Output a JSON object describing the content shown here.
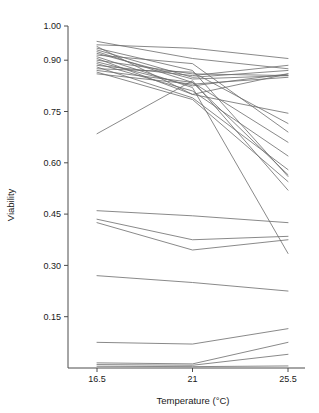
{
  "chart_data": {
    "type": "line",
    "title": "",
    "xlabel": "Temperature (°C)",
    "ylabel": "Viability",
    "x": [
      16.5,
      21,
      25.5
    ],
    "xtick_labels": [
      "16.5",
      "21",
      "25.5"
    ],
    "ytick_labels": [
      "1.00",
      "0.90",
      "0.75",
      "0.60",
      "0.45",
      "0.30",
      "0.15"
    ],
    "ytick_values": [
      1.0,
      0.9,
      0.75,
      0.6,
      0.45,
      0.3,
      0.15
    ],
    "ylim": [
      0.0,
      1.0
    ],
    "xlim": [
      16.5,
      25.5
    ],
    "grid": false,
    "legend": "none",
    "series": [
      {
        "name": "line-01",
        "values": [
          0.955,
          0.905,
          0.875
        ]
      },
      {
        "name": "line-02",
        "values": [
          0.945,
          0.935,
          0.905
        ]
      },
      {
        "name": "line-03",
        "values": [
          0.94,
          0.8,
          0.86
        ]
      },
      {
        "name": "line-04",
        "values": [
          0.935,
          0.87,
          0.56
        ]
      },
      {
        "name": "line-05",
        "values": [
          0.93,
          0.85,
          0.87
        ]
      },
      {
        "name": "line-06",
        "values": [
          0.925,
          0.835,
          0.66
        ]
      },
      {
        "name": "line-07",
        "values": [
          0.92,
          0.845,
          0.855
        ]
      },
      {
        "name": "line-08",
        "values": [
          0.915,
          0.89,
          0.69
        ]
      },
      {
        "name": "line-09",
        "values": [
          0.91,
          0.82,
          0.335
        ]
      },
      {
        "name": "line-10",
        "values": [
          0.905,
          0.8,
          0.745
        ]
      },
      {
        "name": "line-11",
        "values": [
          0.9,
          0.86,
          0.855
        ]
      },
      {
        "name": "line-12",
        "values": [
          0.895,
          0.825,
          0.86
        ]
      },
      {
        "name": "line-13",
        "values": [
          0.89,
          0.81,
          0.62
        ]
      },
      {
        "name": "line-14",
        "values": [
          0.885,
          0.855,
          0.885
        ]
      },
      {
        "name": "line-15",
        "values": [
          0.88,
          0.79,
          0.58
        ]
      },
      {
        "name": "line-16",
        "values": [
          0.875,
          0.865,
          0.715
        ]
      },
      {
        "name": "line-17",
        "values": [
          0.87,
          0.835,
          0.565
        ]
      },
      {
        "name": "line-18",
        "values": [
          0.865,
          0.785,
          0.545
        ]
      },
      {
        "name": "line-19",
        "values": [
          0.86,
          0.83,
          0.85
        ]
      },
      {
        "name": "line-20",
        "values": [
          0.685,
          0.84,
          0.52
        ]
      },
      {
        "name": "line-21",
        "values": [
          0.46,
          0.445,
          0.425
        ]
      },
      {
        "name": "line-22",
        "values": [
          0.435,
          0.375,
          0.385
        ]
      },
      {
        "name": "line-23",
        "values": [
          0.425,
          0.345,
          0.375
        ]
      },
      {
        "name": "line-24",
        "values": [
          0.27,
          0.25,
          0.225
        ]
      },
      {
        "name": "line-25",
        "values": [
          0.075,
          0.07,
          0.115
        ]
      },
      {
        "name": "line-26",
        "values": [
          0.015,
          0.012,
          0.075
        ]
      },
      {
        "name": "line-27",
        "values": [
          0.01,
          0.008,
          0.04
        ]
      },
      {
        "name": "line-28",
        "values": [
          0.005,
          0.004,
          0.006
        ]
      }
    ]
  },
  "colors": {
    "line": "#6b6b6b",
    "axis": "#4d4d4d",
    "text": "#1a1a1a",
    "background": "#ffffff"
  }
}
